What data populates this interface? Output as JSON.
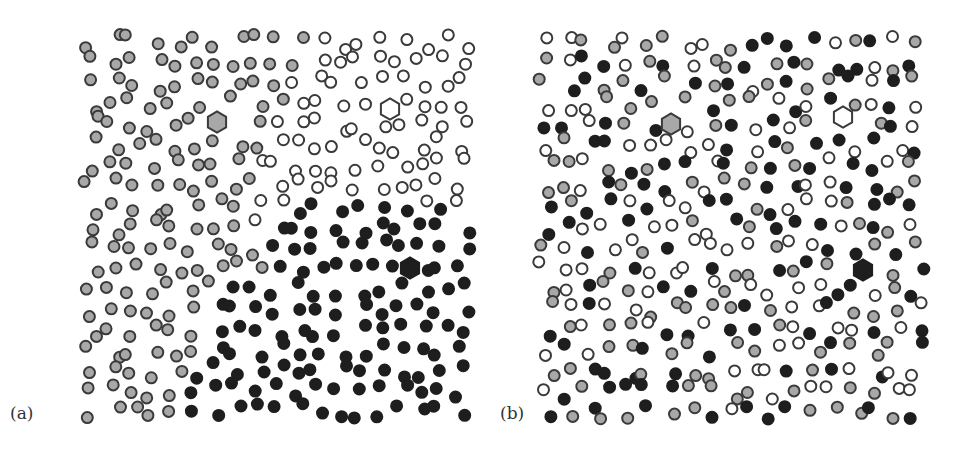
{
  "figure": {
    "panels": [
      {
        "id": "a",
        "label": "(a)",
        "description": "Ordered/segregated state: three domains of colored particles around hexagonal seeds",
        "origin_x": 82,
        "label_pos": [
          10,
          405
        ],
        "seeds": [
          {
            "type": "gray",
            "x": 217,
            "y": 122
          },
          {
            "type": "white",
            "x": 390,
            "y": 109
          },
          {
            "type": "black",
            "x": 410,
            "y": 268
          }
        ]
      },
      {
        "id": "b",
        "label": "(b)",
        "description": "Disordered/mixed state: particles of three types randomly intermixed",
        "origin_x": 536,
        "label_pos": [
          500,
          405
        ],
        "seeds": [
          {
            "type": "gray",
            "x": 671,
            "y": 124
          },
          {
            "type": "white",
            "x": 843,
            "y": 117
          },
          {
            "type": "black",
            "x": 863,
            "y": 270
          }
        ]
      }
    ],
    "particle_types": {
      "gray": {
        "fill": "#a8a8a8",
        "stroke": "#3a3a3a"
      },
      "white": {
        "fill": "#ffffff",
        "stroke": "#3a3a3a"
      },
      "black": {
        "fill": "#1e1e1e",
        "stroke": "#1e1e1e"
      }
    },
    "particle_radius": 5.5,
    "seed_radius": 10.5,
    "field": {
      "width": 390,
      "height": 390,
      "top": 32,
      "cols": 19,
      "rows": 19
    }
  }
}
